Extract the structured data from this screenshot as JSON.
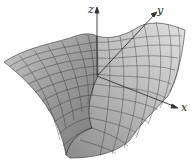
{
  "figure": {
    "type": "3d-surface",
    "axes": {
      "z": {
        "label": "z"
      },
      "y": {
        "label": "y"
      },
      "x": {
        "label": "x"
      }
    },
    "colors": {
      "surface_light": "#d8d8d8",
      "surface_mid": "#a6a6a6",
      "surface_dark": "#6a6a6a",
      "grid": "#2a2a2a",
      "axis": "#333333"
    }
  }
}
